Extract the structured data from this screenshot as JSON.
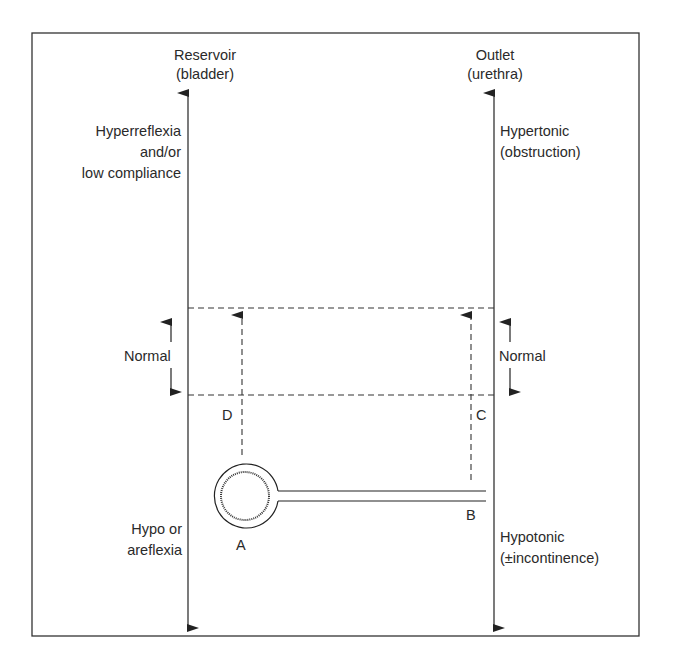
{
  "diagram": {
    "left_axis": {
      "title": "Reservoir",
      "subtitle": "(bladder)",
      "upper_label": [
        "Hyperreflexia",
        "and/or",
        "low compliance"
      ],
      "normal_label": "Normal",
      "lower_label": [
        "Hypo or",
        "areflexia"
      ]
    },
    "right_axis": {
      "title": "Outlet",
      "subtitle": "(urethra)",
      "upper_label": [
        "Hypertonic",
        "(obstruction)"
      ],
      "normal_label": "Normal",
      "lower_label": [
        "Hypotonic",
        "(±incontinence)"
      ]
    },
    "points": {
      "A": "A",
      "B": "B",
      "C": "C",
      "D": "D"
    },
    "colors": {
      "line": "#222222",
      "background": "#ffffff"
    }
  }
}
